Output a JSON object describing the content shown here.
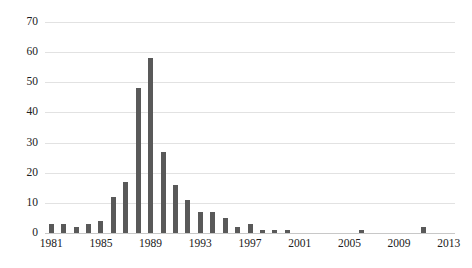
{
  "chart_data": {
    "type": "bar",
    "title": "",
    "subtitle": "",
    "xlabel": "",
    "ylabel": "",
    "grid": true,
    "legend": false,
    "legend_position": "none",
    "bar_color": "#595959",
    "gridline_color": "#e2e2e2",
    "axis_color": "#c8c8c8",
    "xlim": [
      1980.5,
      2013.5
    ],
    "ylim": [
      0,
      70
    ],
    "y_ticks": [
      0,
      10,
      20,
      30,
      40,
      50,
      60,
      70
    ],
    "y_tick_labels": [
      "0",
      "10",
      "20",
      "30",
      "40",
      "50",
      "60",
      "70"
    ],
    "x_ticks": [
      1981,
      1985,
      1989,
      1993,
      1997,
      2001,
      2005,
      2009,
      2013
    ],
    "x_tick_labels": [
      "1981",
      "1985",
      "1989",
      "1993",
      "1997",
      "2001",
      "2005",
      "2009",
      "2013"
    ],
    "categories": [
      1981,
      1982,
      1983,
      1984,
      1985,
      1986,
      1987,
      1988,
      1989,
      1990,
      1991,
      1992,
      1993,
      1994,
      1995,
      1996,
      1997,
      1998,
      1999,
      2000,
      2001,
      2002,
      2003,
      2004,
      2005,
      2006,
      2007,
      2008,
      2009,
      2010,
      2011,
      2012,
      2013
    ],
    "values": [
      3,
      3,
      2,
      3,
      4,
      12,
      17,
      48,
      58,
      27,
      16,
      11,
      7,
      7,
      5,
      2,
      3,
      1,
      1,
      1,
      0,
      0,
      0,
      0,
      0,
      1,
      0,
      0,
      0,
      0,
      2,
      0,
      0
    ]
  }
}
